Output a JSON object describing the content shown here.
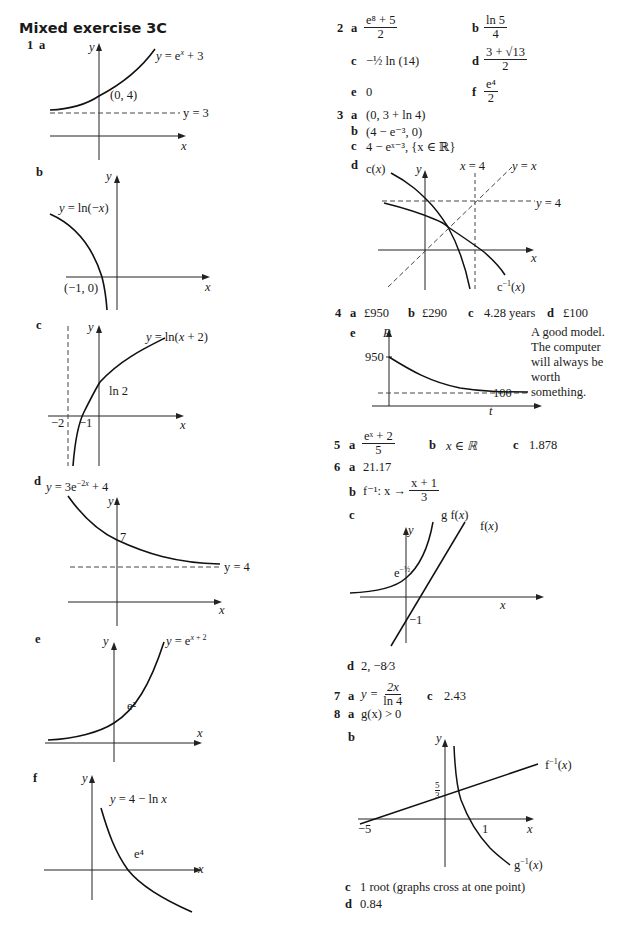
{
  "page": {
    "title": "Mixed exercise 3C"
  },
  "q1": {
    "number": "1",
    "a": {
      "label": "a",
      "curve_label": "y = e^x + 3",
      "point": "(0, 4)",
      "asymptote": "y = 3",
      "x_axis": "x",
      "y_axis": "y"
    },
    "b": {
      "label": "b",
      "curve_label": "y = ln(−x)",
      "point": "(−1, 0)",
      "x_axis": "x",
      "y_axis": "y"
    },
    "c": {
      "label": "c",
      "curve_label": "y = ln(x + 2)",
      "intercept": "ln 2",
      "tick_neg2": "−2",
      "tick_neg1": "−1",
      "x_axis": "x",
      "y_axis": "y"
    },
    "d": {
      "label": "d",
      "curve_label": "y = 3e^−2x + 4",
      "intercept": "7",
      "asymptote": "y = 4",
      "x_axis": "x",
      "y_axis": "y"
    },
    "e": {
      "label": "e",
      "curve_label": "y = e^x + 2",
      "intercept": "e²",
      "x_axis": "x",
      "y_axis": "y"
    },
    "f": {
      "label": "f",
      "curve_label": "y = 4 − ln x",
      "intercept": "e⁴",
      "x_axis": "x",
      "y_axis": "y"
    }
  },
  "q2": {
    "number": "2",
    "a": {
      "label": "a",
      "num": "e⁸ + 5",
      "den": "2"
    },
    "b": {
      "label": "b",
      "num": "ln 5",
      "den": "4"
    },
    "c": {
      "label": "c",
      "value": "−½ ln (14)"
    },
    "d": {
      "label": "d",
      "num": "3 + √13",
      "den": "2"
    },
    "e": {
      "label": "e",
      "value": "0"
    },
    "f": {
      "label": "f",
      "num": "e⁴",
      "den": "2"
    }
  },
  "q3": {
    "number": "3",
    "a": {
      "label": "a",
      "value": "(0, 3 + ln 4)"
    },
    "b": {
      "label": "b",
      "value": "(4 − e⁻³, 0)"
    },
    "c": {
      "label": "c",
      "value": "4 − eˣ⁻³, {x ∈ ℝ}"
    },
    "d": {
      "label": "d",
      "c_label": "c(x)",
      "cinv_label": "c⁻¹(x)",
      "vline": "x = 4",
      "hline": "y = 4",
      "diag": "y = x",
      "x_axis": "x",
      "y_axis": "y"
    }
  },
  "q4": {
    "number": "4",
    "a": {
      "label": "a",
      "value": "£950"
    },
    "b": {
      "label": "b",
      "value": "£290"
    },
    "c": {
      "label": "c",
      "value": "4.28 years"
    },
    "d": {
      "label": "d",
      "value": "£100"
    },
    "e": {
      "label": "e",
      "p_axis": "P",
      "t_axis": "t",
      "start": "950",
      "asymptote": "100",
      "note": "A good model. The computer will always be worth something."
    }
  },
  "q5": {
    "number": "5",
    "a": {
      "label": "a",
      "num": "eˣ + 2",
      "den": "5"
    },
    "b": {
      "label": "b",
      "value": "x ∈ ℝ"
    },
    "c": {
      "label": "c",
      "value": "1.878"
    }
  },
  "q6": {
    "number": "6",
    "a": {
      "label": "a",
      "value": "21.17"
    },
    "b": {
      "label": "b",
      "prefix": "f⁻¹: x →",
      "num": "x + 1",
      "den": "3"
    },
    "c": {
      "label": "c",
      "gf_label": "g f(x)",
      "f_label": "f(x)",
      "intercept_gf": "e^−½",
      "intercept_f": "−1",
      "x_axis": "x",
      "y_axis": "y"
    },
    "d": {
      "label": "d",
      "value": "2, −8⁄3"
    }
  },
  "q7": {
    "number": "7",
    "a": {
      "label": "a",
      "prefix": "y =",
      "num": "2x",
      "den": "ln 4"
    },
    "c": {
      "label": "c",
      "value": "2.43"
    }
  },
  "q8": {
    "number": "8",
    "a": {
      "label": "a",
      "value": "g(x) > 0"
    },
    "b": {
      "label": "b",
      "finv_label": "f⁻¹(x)",
      "ginv_label": "g⁻¹(x)",
      "intercept": "5⁄3",
      "tick_neg5": "−5",
      "tick_1": "1",
      "x_axis": "x",
      "y_axis": "y"
    },
    "c": {
      "label": "c",
      "value": "1 root (graphs cross at one point)"
    },
    "d": {
      "label": "d",
      "value": "0.84"
    }
  }
}
